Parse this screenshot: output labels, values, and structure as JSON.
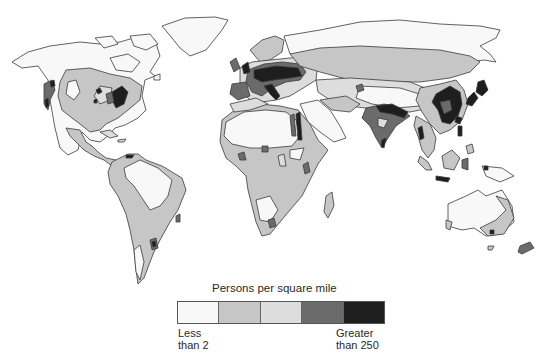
{
  "map": {
    "subject": "World population density",
    "projection": "world map (continents)",
    "colors": {
      "class_1": "#f8f8f8",
      "class_2": "#c6c6c6",
      "class_3": "#dddddd",
      "class_4": "#6b6b6b",
      "class_5": "#1e1e1e",
      "outline": "#3a3a3a",
      "ocean": "#ffffff"
    },
    "regions": [
      {
        "name": "North America",
        "dominant_class": 1,
        "dense_areas": [
          "US Northeast",
          "California"
        ]
      },
      {
        "name": "Greenland",
        "dominant_class": 1
      },
      {
        "name": "Central America",
        "dominant_class": 2
      },
      {
        "name": "South America",
        "dominant_class": 2,
        "dense_areas": [
          "Southeast Brazil",
          "Buenos Aires"
        ]
      },
      {
        "name": "Europe",
        "dominant_class": 4,
        "dense_areas": [
          "Western/Central Europe",
          "Italy",
          "UK"
        ]
      },
      {
        "name": "Africa",
        "dominant_class": 2,
        "sparse_areas": [
          "Sahara",
          "Kalahari"
        ],
        "dense_areas": [
          "Nile Valley",
          "Great Lakes"
        ]
      },
      {
        "name": "Middle East",
        "dominant_class": 1
      },
      {
        "name": "Russia / Siberia",
        "dominant_class": 1
      },
      {
        "name": "South Asia",
        "dominant_class": 5,
        "dense_areas": [
          "Ganges Plain",
          "India"
        ]
      },
      {
        "name": "East Asia",
        "dominant_class": 5,
        "dense_areas": [
          "Eastern China",
          "Japan",
          "Korea"
        ]
      },
      {
        "name": "Southeast Asia",
        "dominant_class": 2,
        "dense_areas": [
          "Java",
          "Philippines"
        ]
      },
      {
        "name": "Australia",
        "dominant_class": 1,
        "dense_areas": [
          "Southeast coast"
        ]
      },
      {
        "name": "New Zealand",
        "dominant_class": 2
      }
    ]
  },
  "legend": {
    "title": "Persons per square mile",
    "swatches": [
      {
        "color": "#f8f8f8",
        "label": "Less than 2"
      },
      {
        "color": "#c6c6c6",
        "label": ""
      },
      {
        "color": "#dddddd",
        "label": ""
      },
      {
        "color": "#6b6b6b",
        "label": ""
      },
      {
        "color": "#1e1e1e",
        "label": "Greater than 250"
      }
    ],
    "low_label_line1": "Less",
    "low_label_line2": "than 2",
    "high_label_line1": "Greater",
    "high_label_line2": "than 250"
  }
}
